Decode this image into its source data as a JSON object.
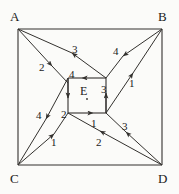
{
  "figure": {
    "stroke_color": "#33312e",
    "text_color": "#1a1a1a",
    "background": "#fbfbf9",
    "outer_square": {
      "name": "outer-square",
      "x1": 18,
      "y1": 29,
      "x2": 162,
      "y2": 165
    },
    "inner_square": {
      "name": "inner-square",
      "x1": 68,
      "y1": 78,
      "x2": 106,
      "y2": 113
    },
    "corners": [
      {
        "id": "A",
        "label": "A",
        "x": 10,
        "y": 10,
        "vx": 18,
        "vy": 29
      },
      {
        "id": "B",
        "label": "B",
        "x": 158,
        "y": 10,
        "vx": 162,
        "vy": 29
      },
      {
        "id": "C",
        "label": "C",
        "x": 10,
        "y": 172,
        "vx": 18,
        "vy": 165
      },
      {
        "id": "D",
        "label": "D",
        "x": 158,
        "y": 172,
        "vx": 162,
        "vy": 165
      }
    ],
    "center_point": {
      "id": "E",
      "label": "E",
      "x": 80,
      "y": 85,
      "dot_x": 87,
      "dot_y": 99
    },
    "edge_labels": [
      {
        "id": "top-left-outer",
        "text": "3",
        "x": 72,
        "y": 44
      },
      {
        "id": "upper-left-inner",
        "text": "2",
        "x": 39,
        "y": 62
      },
      {
        "id": "inner-top",
        "text": "4",
        "x": 69,
        "y": 69
      },
      {
        "id": "upper-right-outer",
        "text": "4",
        "x": 113,
        "y": 46
      },
      {
        "id": "upper-right-inner",
        "text": "1",
        "x": 129,
        "y": 78
      },
      {
        "id": "inner-right",
        "text": "3",
        "x": 101,
        "y": 84
      },
      {
        "id": "lower-left-outer",
        "text": "4",
        "x": 36,
        "y": 110
      },
      {
        "id": "inner-left",
        "text": "2",
        "x": 61,
        "y": 109
      },
      {
        "id": "lower-left-inner",
        "text": "1",
        "x": 51,
        "y": 137
      },
      {
        "id": "inner-bottom",
        "text": "1",
        "x": 91,
        "y": 118
      },
      {
        "id": "lower-right-outer",
        "text": "3",
        "x": 122,
        "y": 121
      },
      {
        "id": "lower-right-inner",
        "text": "2",
        "x": 96,
        "y": 137
      }
    ]
  }
}
